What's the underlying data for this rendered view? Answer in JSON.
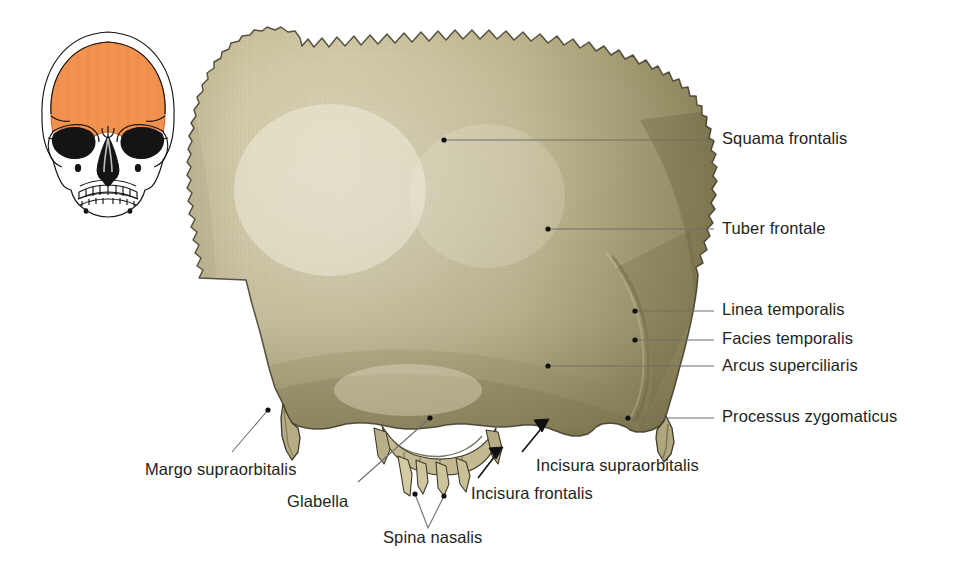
{
  "figure": {
    "kind": "anatomical-illustration",
    "background_color": "#ffffff"
  },
  "orientation_thumbnail": {
    "name": "skull-orientation-thumbnail",
    "description": "Anterior view line drawing of the human skull with the frontal bone highlighted",
    "highlight_color": "#f2924f",
    "outline_color": "#1a1a1a"
  },
  "bone": {
    "name": "os-frontale",
    "light_color": "#efe8d2",
    "mid_color": "#ddd6b6",
    "shadow_color": "#9b9470",
    "edge_color": "#4a4636"
  },
  "leader": {
    "line_color": "#6e6e6e",
    "dot_color": "#111111",
    "arrow_color": "#111111"
  },
  "labels": [
    {
      "id": "squama-frontalis",
      "text": "Squama frontalis",
      "x": 722,
      "y": 129,
      "anchor": "left"
    },
    {
      "id": "tuber-frontale",
      "text": "Tuber frontale",
      "x": 722,
      "y": 219,
      "anchor": "left"
    },
    {
      "id": "linea-temporalis",
      "text": "Linea temporalis",
      "x": 722,
      "y": 299,
      "anchor": "left"
    },
    {
      "id": "facies-temporalis",
      "text": "Facies temporalis",
      "x": 722,
      "y": 326,
      "anchor": "left"
    },
    {
      "id": "arcus-superciliaris",
      "text": "Arcus superciliaris",
      "x": 722,
      "y": 356,
      "anchor": "left"
    },
    {
      "id": "processus-zygomaticus",
      "text": "Processus zygomaticus",
      "x": 722,
      "y": 409,
      "anchor": "left"
    },
    {
      "id": "margo-supraorbitalis",
      "text": "Margo supraorbitalis",
      "x": 145,
      "y": 464,
      "anchor": "left"
    },
    {
      "id": "glabella",
      "text": "Glabella",
      "x": 287,
      "y": 495,
      "anchor": "left"
    },
    {
      "id": "spina-nasalis",
      "text": "Spina nasalis",
      "x": 383,
      "y": 531,
      "anchor": "left"
    },
    {
      "id": "incisura-frontalis",
      "text": "Incisura frontalis",
      "x": 471,
      "y": 487,
      "anchor": "left"
    },
    {
      "id": "incisura-supraorbitalis",
      "text": "Incisura supraorbitalis",
      "x": 536,
      "y": 459,
      "anchor": "left"
    }
  ]
}
